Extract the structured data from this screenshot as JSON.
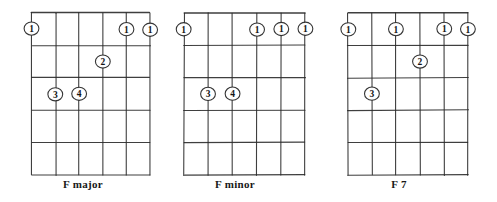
{
  "sheet": {
    "title": "Guitar chord diagrams",
    "background_color": "#ffffff",
    "ink_color": "#2b2b2b",
    "text_color": "#181818"
  },
  "chart_data": {
    "type": "diagram",
    "diagram_kind": "guitar-chord-chart",
    "strings": 6,
    "frets": 5,
    "string_labels": [
      "6",
      "5",
      "4",
      "3",
      "2",
      "1"
    ],
    "fret_labels": [
      "1",
      "2",
      "3",
      "4",
      "5"
    ],
    "charts": [
      {
        "id": "f-major",
        "label": "F major",
        "fingerings": [
          {
            "string": 6,
            "fret": 1,
            "finger": "1"
          },
          {
            "string": 2,
            "fret": 1,
            "finger": "1"
          },
          {
            "string": 1,
            "fret": 1,
            "finger": "1"
          },
          {
            "string": 3,
            "fret": 2,
            "finger": "2"
          },
          {
            "string": 5,
            "fret": 3,
            "finger": "3"
          },
          {
            "string": 4,
            "fret": 3,
            "finger": "4"
          }
        ]
      },
      {
        "id": "f-minor",
        "label": "F minor",
        "fingerings": [
          {
            "string": 6,
            "fret": 1,
            "finger": "1"
          },
          {
            "string": 3,
            "fret": 1,
            "finger": "1"
          },
          {
            "string": 2,
            "fret": 1,
            "finger": "1"
          },
          {
            "string": 1,
            "fret": 1,
            "finger": "1"
          },
          {
            "string": 5,
            "fret": 3,
            "finger": "3"
          },
          {
            "string": 4,
            "fret": 3,
            "finger": "4"
          }
        ]
      },
      {
        "id": "f-seven",
        "label": "F 7",
        "fingerings": [
          {
            "string": 6,
            "fret": 1,
            "finger": "1"
          },
          {
            "string": 4,
            "fret": 1,
            "finger": "1"
          },
          {
            "string": 2,
            "fret": 1,
            "finger": "1"
          },
          {
            "string": 1,
            "fret": 1,
            "finger": "1"
          },
          {
            "string": 3,
            "fret": 2,
            "finger": "2"
          },
          {
            "string": 5,
            "fret": 3,
            "finger": "3"
          }
        ]
      }
    ]
  },
  "diagrams": [
    {
      "label": "F major",
      "offset_x": 0,
      "grid_left": 32,
      "grid_right": 150
    },
    {
      "label": "F minor",
      "offset_x": 152,
      "grid_left": 32,
      "grid_right": 153
    },
    {
      "label": "F 7",
      "offset_x": 316,
      "grid_left": 32,
      "grid_right": 152
    }
  ]
}
